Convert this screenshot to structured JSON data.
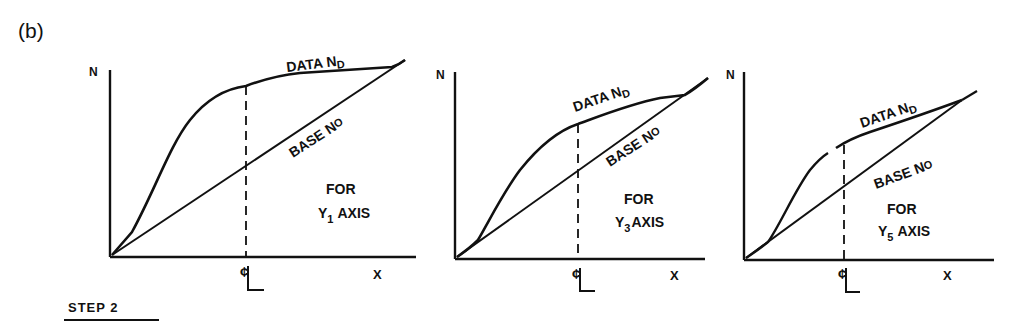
{
  "figure": {
    "label": "(b)",
    "step_label": "STEP 2"
  },
  "panels": [
    {
      "y_axis_label": "N",
      "x_axis_label": "X",
      "centerline_label": "¢",
      "data_label": "DATA N",
      "data_sub": "D",
      "base_label": "BASE N",
      "base_sub": "O",
      "for_label": "FOR",
      "axis_label_prefix": "Y",
      "axis_label_sub": "1",
      "axis_label_suffix": "AXIS"
    },
    {
      "y_axis_label": "N",
      "x_axis_label": "X",
      "centerline_label": "¢",
      "data_label": "DATA N",
      "data_sub": "D",
      "base_label": "BASE N",
      "base_sub": "O",
      "for_label": "FOR",
      "axis_label_prefix": "Y",
      "axis_label_sub": "3",
      "axis_label_suffix": "AXIS"
    },
    {
      "y_axis_label": "N",
      "x_axis_label": "X",
      "centerline_label": "¢",
      "data_label": "DATA N",
      "data_sub": "D",
      "base_label": "BASE N",
      "base_sub": "O",
      "for_label": "FOR",
      "axis_label_prefix": "Y",
      "axis_label_sub": "5",
      "axis_label_suffix": "AXIS"
    }
  ],
  "colors": {
    "ink": "#111111",
    "background": "#ffffff"
  }
}
